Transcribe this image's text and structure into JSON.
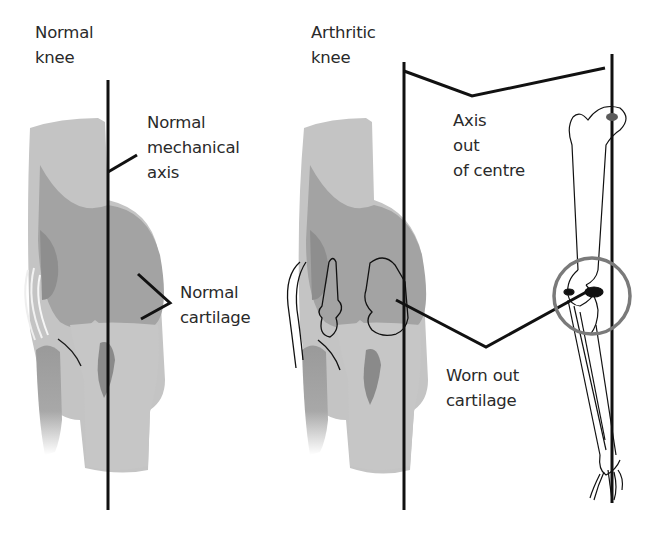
{
  "diagram": {
    "colors": {
      "background": "#ffffff",
      "light_gray": "#c2c2c2",
      "mid_gray": "#a9a9a9",
      "dark_gray": "#8c8c8c",
      "line": "#111111",
      "circle": "#7a7a7a"
    },
    "panels": [
      {
        "id": "normal",
        "heading": [
          "Normal",
          "knee"
        ],
        "callouts": [
          {
            "lines": [
              "Normal",
              "mechanical",
              "axis"
            ]
          },
          {
            "lines": [
              "Normal",
              "cartilage"
            ]
          }
        ]
      },
      {
        "id": "arthritic",
        "heading": [
          "Arthritic",
          "knee"
        ],
        "callouts": [
          {
            "lines": [
              "Axis",
              "out",
              "of centre"
            ]
          },
          {
            "lines": [
              "Worn out",
              "cartilage"
            ]
          }
        ]
      }
    ]
  }
}
